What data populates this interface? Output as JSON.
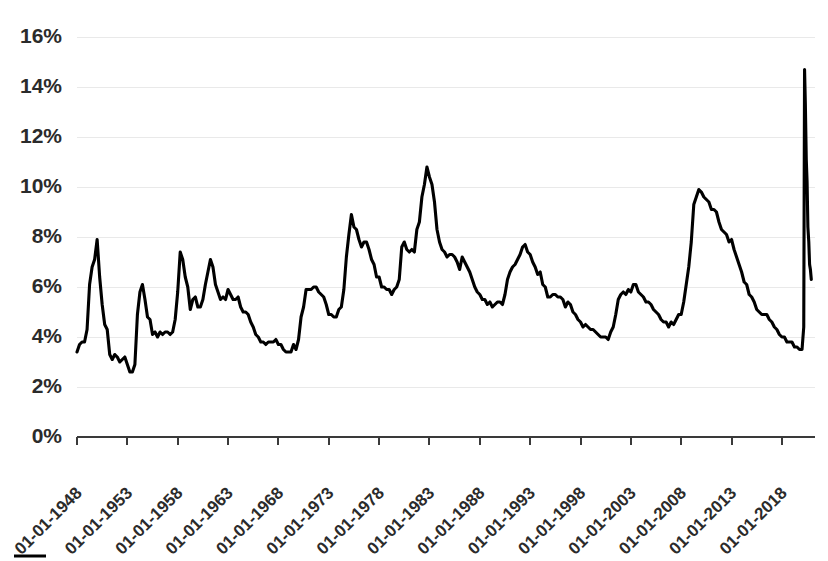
{
  "chart_data": {
    "type": "line",
    "title": "",
    "xlabel": "",
    "ylabel": "",
    "ylim": [
      0,
      16
    ],
    "yticks": [
      0,
      2,
      4,
      6,
      8,
      10,
      12,
      14,
      16
    ],
    "ytick_labels": [
      "0%",
      "2%",
      "4%",
      "6%",
      "8%",
      "10%",
      "12%",
      "14%",
      "16%"
    ],
    "xtick_labels": [
      "01-01-1948",
      "01-01-1953",
      "01-01-1958",
      "01-01-1963",
      "01-01-1968",
      "01-01-1973",
      "01-01-1978",
      "01-01-1983",
      "01-01-1988",
      "01-01-1993",
      "01-01-1998",
      "01-01-2003",
      "01-01-2008",
      "01-01-2013",
      "01-01-2018"
    ],
    "xlim": [
      "01-01-1948",
      "01-01-2021"
    ],
    "grid": "horizontal",
    "legend": "bottom",
    "line_color": "#000000",
    "gridline_color": "#e9e9e9",
    "axis_color": "#3a3a3a",
    "background_color": "#ffffff",
    "series": [
      {
        "name": "Unemployment Rate",
        "x": [
          1948.0,
          1948.25,
          1948.5,
          1948.75,
          1949.0,
          1949.25,
          1949.5,
          1949.75,
          1950.0,
          1950.25,
          1950.5,
          1950.75,
          1951.0,
          1951.25,
          1951.5,
          1951.75,
          1952.0,
          1952.25,
          1952.5,
          1952.75,
          1953.0,
          1953.25,
          1953.5,
          1953.75,
          1954.0,
          1954.25,
          1954.5,
          1954.75,
          1955.0,
          1955.25,
          1955.5,
          1955.75,
          1956.0,
          1956.25,
          1956.5,
          1956.75,
          1957.0,
          1957.25,
          1957.5,
          1957.75,
          1958.0,
          1958.25,
          1958.5,
          1958.75,
          1959.0,
          1959.25,
          1959.5,
          1959.75,
          1960.0,
          1960.25,
          1960.5,
          1960.75,
          1961.0,
          1961.25,
          1961.5,
          1961.75,
          1962.0,
          1962.25,
          1962.5,
          1962.75,
          1963.0,
          1963.25,
          1963.5,
          1963.75,
          1964.0,
          1964.25,
          1964.5,
          1964.75,
          1965.0,
          1965.25,
          1965.5,
          1965.75,
          1966.0,
          1966.25,
          1966.5,
          1966.75,
          1967.0,
          1967.25,
          1967.5,
          1967.75,
          1968.0,
          1968.25,
          1968.5,
          1968.75,
          1969.0,
          1969.25,
          1969.5,
          1969.75,
          1970.0,
          1970.25,
          1970.5,
          1970.75,
          1971.0,
          1971.25,
          1971.5,
          1971.75,
          1972.0,
          1972.25,
          1972.5,
          1972.75,
          1973.0,
          1973.25,
          1973.5,
          1973.75,
          1974.0,
          1974.25,
          1974.5,
          1974.75,
          1975.0,
          1975.25,
          1975.5,
          1975.75,
          1976.0,
          1976.25,
          1976.5,
          1976.75,
          1977.0,
          1977.25,
          1977.5,
          1977.75,
          1978.0,
          1978.25,
          1978.5,
          1978.75,
          1979.0,
          1979.25,
          1979.5,
          1979.75,
          1980.0,
          1980.25,
          1980.5,
          1980.75,
          1981.0,
          1981.25,
          1981.5,
          1981.75,
          1982.0,
          1982.25,
          1982.5,
          1982.75,
          1983.0,
          1983.25,
          1983.5,
          1983.75,
          1984.0,
          1984.25,
          1984.5,
          1984.75,
          1985.0,
          1985.25,
          1985.5,
          1985.75,
          1986.0,
          1986.25,
          1986.5,
          1986.75,
          1987.0,
          1987.25,
          1987.5,
          1987.75,
          1988.0,
          1988.25,
          1988.5,
          1988.75,
          1989.0,
          1989.25,
          1989.5,
          1989.75,
          1990.0,
          1990.25,
          1990.5,
          1990.75,
          1991.0,
          1991.25,
          1991.5,
          1991.75,
          1992.0,
          1992.25,
          1992.5,
          1992.75,
          1993.0,
          1993.25,
          1993.5,
          1993.75,
          1994.0,
          1994.25,
          1994.5,
          1994.75,
          1995.0,
          1995.25,
          1995.5,
          1995.75,
          1996.0,
          1996.25,
          1996.5,
          1996.75,
          1997.0,
          1997.25,
          1997.5,
          1997.75,
          1998.0,
          1998.25,
          1998.5,
          1998.75,
          1999.0,
          1999.25,
          1999.5,
          1999.75,
          2000.0,
          2000.25,
          2000.5,
          2000.75,
          2001.0,
          2001.25,
          2001.5,
          2001.75,
          2002.0,
          2002.25,
          2002.5,
          2002.75,
          2003.0,
          2003.25,
          2003.5,
          2003.75,
          2004.0,
          2004.25,
          2004.5,
          2004.75,
          2005.0,
          2005.25,
          2005.5,
          2005.75,
          2006.0,
          2006.25,
          2006.5,
          2006.75,
          2007.0,
          2007.25,
          2007.5,
          2007.75,
          2008.0,
          2008.25,
          2008.5,
          2008.75,
          2009.0,
          2009.25,
          2009.5,
          2009.75,
          2010.0,
          2010.25,
          2010.5,
          2010.75,
          2011.0,
          2011.25,
          2011.5,
          2011.75,
          2012.0,
          2012.25,
          2012.5,
          2012.75,
          2013.0,
          2013.25,
          2013.5,
          2013.75,
          2014.0,
          2014.25,
          2014.5,
          2014.75,
          2015.0,
          2015.25,
          2015.5,
          2015.75,
          2016.0,
          2016.25,
          2016.5,
          2016.75,
          2017.0,
          2017.25,
          2017.5,
          2017.75,
          2018.0,
          2018.25,
          2018.5,
          2018.75,
          2019.0,
          2019.25,
          2019.5,
          2019.75,
          2020.0,
          2020.17,
          2020.25,
          2020.33,
          2020.42,
          2020.5,
          2020.58,
          2020.67,
          2020.75,
          2020.83,
          2020.92
        ],
        "values": [
          3.4,
          3.7,
          3.8,
          3.8,
          4.3,
          6.1,
          6.8,
          7.1,
          7.9,
          6.4,
          5.3,
          4.5,
          4.3,
          3.3,
          3.1,
          3.3,
          3.2,
          3.0,
          3.1,
          3.2,
          2.9,
          2.6,
          2.6,
          2.9,
          4.9,
          5.8,
          6.1,
          5.5,
          4.8,
          4.7,
          4.1,
          4.2,
          4.0,
          4.2,
          4.1,
          4.2,
          4.2,
          4.1,
          4.2,
          4.7,
          5.8,
          7.4,
          7.1,
          6.4,
          6.0,
          5.1,
          5.5,
          5.6,
          5.2,
          5.2,
          5.5,
          6.1,
          6.6,
          7.1,
          6.8,
          6.1,
          5.8,
          5.5,
          5.6,
          5.5,
          5.9,
          5.7,
          5.5,
          5.5,
          5.6,
          5.2,
          5.0,
          5.0,
          4.9,
          4.6,
          4.4,
          4.1,
          4.0,
          3.8,
          3.8,
          3.7,
          3.8,
          3.8,
          3.8,
          3.9,
          3.7,
          3.7,
          3.5,
          3.4,
          3.4,
          3.4,
          3.7,
          3.5,
          3.9,
          4.8,
          5.2,
          5.9,
          5.9,
          5.9,
          6.0,
          6.0,
          5.8,
          5.7,
          5.6,
          5.3,
          4.9,
          4.9,
          4.8,
          4.8,
          5.1,
          5.2,
          5.9,
          7.2,
          8.1,
          8.9,
          8.4,
          8.3,
          7.9,
          7.6,
          7.8,
          7.8,
          7.5,
          7.1,
          6.9,
          6.4,
          6.4,
          6.0,
          6.0,
          5.9,
          5.9,
          5.7,
          5.9,
          6.0,
          6.3,
          7.6,
          7.8,
          7.5,
          7.4,
          7.5,
          7.4,
          8.3,
          8.6,
          9.6,
          10.1,
          10.8,
          10.4,
          10.1,
          9.4,
          8.3,
          7.8,
          7.5,
          7.4,
          7.2,
          7.3,
          7.3,
          7.2,
          7.0,
          6.7,
          7.2,
          7.0,
          6.8,
          6.6,
          6.3,
          6.0,
          5.8,
          5.7,
          5.5,
          5.5,
          5.3,
          5.4,
          5.2,
          5.3,
          5.4,
          5.4,
          5.3,
          5.7,
          6.3,
          6.6,
          6.8,
          6.9,
          7.1,
          7.3,
          7.6,
          7.7,
          7.4,
          7.3,
          7.0,
          6.8,
          6.5,
          6.6,
          6.1,
          6.0,
          5.6,
          5.6,
          5.7,
          5.7,
          5.6,
          5.6,
          5.5,
          5.2,
          5.4,
          5.3,
          5.0,
          4.9,
          4.7,
          4.6,
          4.4,
          4.5,
          4.4,
          4.3,
          4.3,
          4.2,
          4.1,
          4.0,
          4.0,
          4.0,
          3.9,
          4.2,
          4.4,
          4.9,
          5.5,
          5.7,
          5.8,
          5.7,
          5.9,
          5.8,
          6.1,
          6.1,
          5.8,
          5.7,
          5.6,
          5.4,
          5.4,
          5.3,
          5.1,
          5.0,
          4.9,
          4.7,
          4.6,
          4.6,
          4.4,
          4.6,
          4.5,
          4.7,
          4.9,
          4.9,
          5.4,
          6.1,
          6.8,
          7.8,
          9.3,
          9.6,
          9.9,
          9.8,
          9.6,
          9.5,
          9.4,
          9.1,
          9.1,
          9.0,
          8.6,
          8.3,
          8.2,
          8.1,
          7.8,
          7.9,
          7.5,
          7.2,
          6.9,
          6.6,
          6.2,
          6.1,
          5.7,
          5.6,
          5.4,
          5.1,
          5.0,
          4.9,
          4.9,
          4.9,
          4.7,
          4.6,
          4.4,
          4.3,
          4.1,
          4.0,
          4.0,
          3.8,
          3.8,
          3.8,
          3.6,
          3.6,
          3.5,
          3.5,
          4.4,
          14.7,
          13.3,
          11.1,
          10.2,
          8.4,
          7.8,
          6.9,
          6.7,
          6.3
        ]
      }
    ],
    "annotations": [
      {
        "label": "1949 recession peak",
        "value": 7.9
      },
      {
        "label": "1954 recession peak",
        "value": 6.1
      },
      {
        "label": "1958 recession peak",
        "value": 7.4
      },
      {
        "label": "1961 recession peak",
        "value": 7.1
      },
      {
        "label": "1975 recession peak",
        "value": 8.9
      },
      {
        "label": "1982 recession peak",
        "value": 10.8
      },
      {
        "label": "1992 recession peak",
        "value": 7.7
      },
      {
        "label": "2003 peak",
        "value": 6.1
      },
      {
        "label": "2009-2010 recession peak",
        "value": 9.9
      },
      {
        "label": "2020 COVID-19 peak",
        "value": 14.7
      },
      {
        "label": "1953 trough",
        "value": 2.6
      },
      {
        "label": "2019 trough",
        "value": 3.5
      }
    ]
  },
  "legend": {
    "entries": [
      {
        "label": "",
        "color": "#000000"
      }
    ]
  }
}
